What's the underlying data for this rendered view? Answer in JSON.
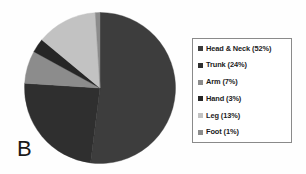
{
  "panel": {
    "label": "B"
  },
  "legend": {
    "position": "right",
    "border_color": "#8a8a8a",
    "background": "#ffffff",
    "entries": [
      {
        "label": "Head & Neck (52%)",
        "swatch_color": "#3d3d3d"
      },
      {
        "label": "Trunk (24%)",
        "swatch_color": "#2f2f2f"
      },
      {
        "label": "Arm (7%)",
        "swatch_color": "#8c8c8c"
      },
      {
        "label": "Hand (3%)",
        "swatch_color": "#262626"
      },
      {
        "label": "Leg (13%)",
        "swatch_color": "#c2c2c2"
      },
      {
        "label": "Foot (1%)",
        "swatch_color": "#8c8c8c"
      }
    ]
  },
  "chart_data": {
    "type": "pie",
    "title": "",
    "subtitle": "",
    "xlabel": "",
    "ylabel": "",
    "grid": false,
    "legend_position": "right",
    "start_angle_deg": 0,
    "direction": "clockwise",
    "center_px": [
      100,
      88
    ],
    "radius_px": 75,
    "labels": [
      "Head & Neck",
      "Trunk",
      "Arm",
      "Hand",
      "Leg",
      "Foot"
    ],
    "values": [
      52,
      24,
      7,
      3,
      13,
      1
    ],
    "units": "percent",
    "slices": [
      {
        "label": "Head & Neck",
        "value": 52,
        "display": "Head & Neck (52%)",
        "color": "#3d3d3d"
      },
      {
        "label": "Trunk",
        "value": 24,
        "display": "Trunk (24%)",
        "color": "#2f2f2f"
      },
      {
        "label": "Arm",
        "value": 7,
        "display": "Arm (7%)",
        "color": "#8c8c8c"
      },
      {
        "label": "Hand",
        "value": 3,
        "display": "Hand (3%)",
        "color": "#262626"
      },
      {
        "label": "Leg",
        "value": 13,
        "display": "Leg (13%)",
        "color": "#c2c2c2"
      },
      {
        "label": "Foot",
        "value": 1,
        "display": "Foot (1%)",
        "color": "#8c8c8c"
      }
    ],
    "annotations": [
      "B"
    ]
  }
}
